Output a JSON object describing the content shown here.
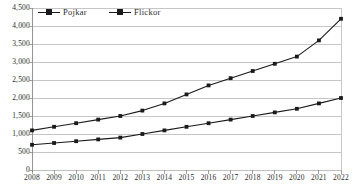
{
  "chart_data": {
    "type": "line",
    "title": "",
    "subtitle": "",
    "xlabel": "",
    "ylabel": "",
    "categories": [
      "2008",
      "2009",
      "2010",
      "2011",
      "2012",
      "2013",
      "2014",
      "2015",
      "2016",
      "2017",
      "2018",
      "2019",
      "2020",
      "2021",
      "2022"
    ],
    "series": [
      {
        "name": "Pojkar",
        "values": [
          1100,
          1200,
          1300,
          1400,
          1500,
          1650,
          1850,
          2100,
          2350,
          2550,
          2750,
          2950,
          3150,
          3600,
          4200
        ]
      },
      {
        "name": "Flickor",
        "values": [
          700,
          750,
          800,
          850,
          900,
          1000,
          1100,
          1200,
          1300,
          1400,
          1500,
          1600,
          1700,
          1850,
          2000
        ]
      }
    ],
    "ylim": [
      0,
      4500
    ],
    "ytick_step": 500,
    "ytick_labels": [
      "4,500",
      "4,000",
      "3,500",
      "3,000",
      "2,500",
      "2,000",
      "1,500",
      "1,000",
      "500",
      "0"
    ],
    "ytick_values": [
      4500,
      4000,
      3500,
      3000,
      2500,
      2000,
      1500,
      1000,
      500,
      0
    ],
    "grid": true,
    "grid_axis": "y",
    "legend_position": "top-left",
    "marker": "square",
    "line_color": "#1a1a1a",
    "grid_color": "#b8b8b8",
    "axis_color": "#888888",
    "background_color": "#ffffff"
  },
  "caption": {
    "cut_off_text": ""
  }
}
